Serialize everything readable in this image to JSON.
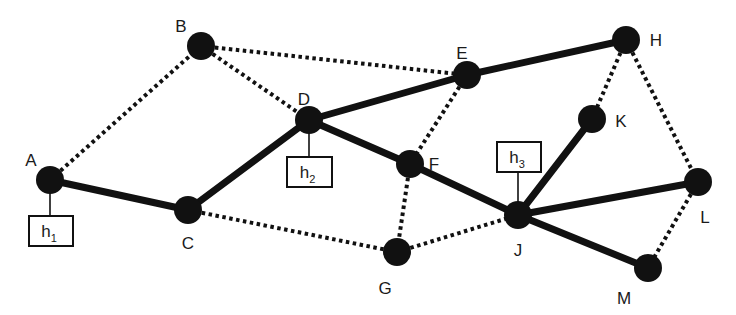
{
  "diagram": {
    "type": "network-graph",
    "colors": {
      "node": "#111111",
      "edge": "#111111",
      "background": "#ffffff",
      "box_border": "#111111"
    },
    "nodes": [
      {
        "id": "A",
        "label": "A",
        "x": 50,
        "y": 180,
        "label_x": 31,
        "label_y": 162
      },
      {
        "id": "B",
        "label": "B",
        "x": 201,
        "y": 46,
        "label_x": 181,
        "label_y": 28
      },
      {
        "id": "C",
        "label": "C",
        "x": 188,
        "y": 210,
        "label_x": 188,
        "label_y": 245
      },
      {
        "id": "D",
        "label": "D",
        "x": 309,
        "y": 120,
        "label_x": 304,
        "label_y": 101
      },
      {
        "id": "E",
        "label": "E",
        "x": 467,
        "y": 75,
        "label_x": 462,
        "label_y": 55
      },
      {
        "id": "F",
        "label": "F",
        "x": 410,
        "y": 164,
        "label_x": 434,
        "label_y": 166
      },
      {
        "id": "G",
        "label": "G",
        "x": 397,
        "y": 252,
        "label_x": 385,
        "label_y": 290
      },
      {
        "id": "H",
        "label": "H",
        "x": 626,
        "y": 40,
        "label_x": 656,
        "label_y": 42
      },
      {
        "id": "J",
        "label": "J",
        "x": 518,
        "y": 215,
        "label_x": 518,
        "label_y": 252
      },
      {
        "id": "K",
        "label": "K",
        "x": 592,
        "y": 119,
        "label_x": 621,
        "label_y": 123
      },
      {
        "id": "L",
        "label": "L",
        "x": 698,
        "y": 182,
        "label_x": 705,
        "label_y": 219
      },
      {
        "id": "M",
        "label": "M",
        "x": 648,
        "y": 268,
        "label_x": 624,
        "label_y": 300
      }
    ],
    "solid_edges": [
      [
        "A",
        "C"
      ],
      [
        "C",
        "D"
      ],
      [
        "D",
        "E"
      ],
      [
        "E",
        "H"
      ],
      [
        "D",
        "F"
      ],
      [
        "F",
        "J"
      ],
      [
        "J",
        "K"
      ],
      [
        "J",
        "L"
      ],
      [
        "J",
        "M"
      ]
    ],
    "dotted_edges": [
      [
        "A",
        "B"
      ],
      [
        "B",
        "D"
      ],
      [
        "B",
        "E"
      ],
      [
        "E",
        "F"
      ],
      [
        "F",
        "G"
      ],
      [
        "C",
        "G"
      ],
      [
        "G",
        "J"
      ],
      [
        "H",
        "K"
      ],
      [
        "H",
        "L"
      ],
      [
        "L",
        "M"
      ]
    ],
    "hosts": [
      {
        "id": "h1",
        "base": "h",
        "sub": "1",
        "attached_to": "A",
        "box_x": 29,
        "box_y": 216,
        "box_w": 44,
        "box_h": 30,
        "line_x": 50,
        "line_y1": 180,
        "line_y2": 216
      },
      {
        "id": "h2",
        "base": "h",
        "sub": "2",
        "attached_to": "D",
        "box_x": 287,
        "box_y": 157,
        "box_w": 45,
        "box_h": 30,
        "line_x": 309,
        "line_y1": 120,
        "line_y2": 157
      },
      {
        "id": "h3",
        "base": "h",
        "sub": "3",
        "attached_to": "J",
        "box_x": 497,
        "box_y": 142,
        "box_w": 44,
        "box_h": 30,
        "line_x": 518,
        "line_y1": 172,
        "line_y2": 215
      }
    ]
  }
}
